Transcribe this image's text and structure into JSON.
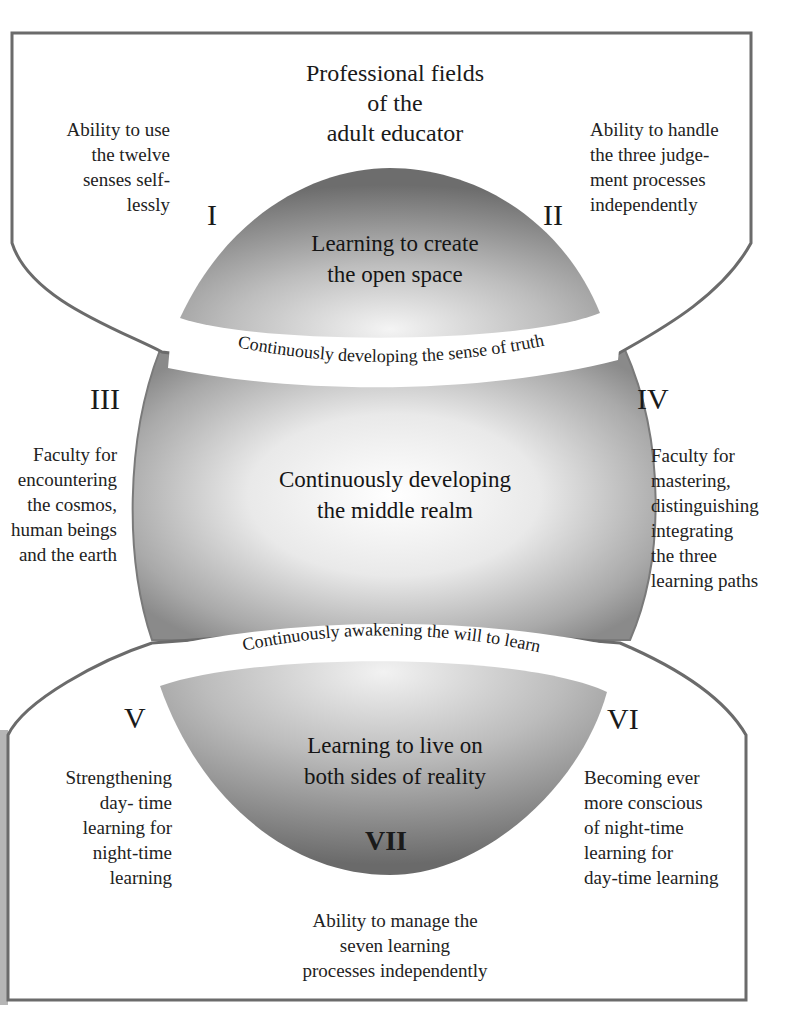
{
  "title": {
    "lines": [
      "Professional fields",
      "of the",
      "adult educator"
    ]
  },
  "fields": {
    "I": {
      "numeral": "I",
      "lines": [
        "Ability to use",
        "the twelve",
        "senses  self-",
        "lessly"
      ]
    },
    "II": {
      "numeral": "II",
      "lines": [
        "Ability to handle",
        "the three judge-",
        "ment processes",
        "independently"
      ]
    },
    "III": {
      "numeral": "III",
      "lines": [
        "Faculty for",
        "encountering",
        "the cosmos,",
        "human beings",
        "and the earth"
      ]
    },
    "IV": {
      "numeral": "IV",
      "lines": [
        "Faculty for",
        "mastering,",
        "distinguishing",
        "integrating",
        "the three",
        "learning paths"
      ]
    },
    "V": {
      "numeral": "V",
      "lines": [
        "Strengthening",
        "day- time",
        "learning for",
        "night-time",
        "learning"
      ]
    },
    "VI": {
      "numeral": "VI",
      "lines": [
        "Becoming ever",
        "more conscious",
        "of night-time",
        "learning for",
        "day-time learning"
      ]
    },
    "VII": {
      "numeral": "VII",
      "lines": [
        "Ability to manage the",
        "seven learning",
        "processes independently"
      ]
    }
  },
  "core": {
    "top": [
      "Learning to create",
      "the open space"
    ],
    "middle": [
      "Continuously developing",
      "the middle realm"
    ],
    "bottom": [
      "Learning to live on",
      "both sides of reality"
    ]
  },
  "bands": {
    "upper": "Continuously developing the sense of truth",
    "lower": "Continuously awakening the will to learn"
  },
  "colors": {
    "frame_stroke": "#6b6b6b",
    "shade_dark": "#6e6e6e",
    "shade_light": "#ffffff",
    "text": "#1e1e1e"
  }
}
